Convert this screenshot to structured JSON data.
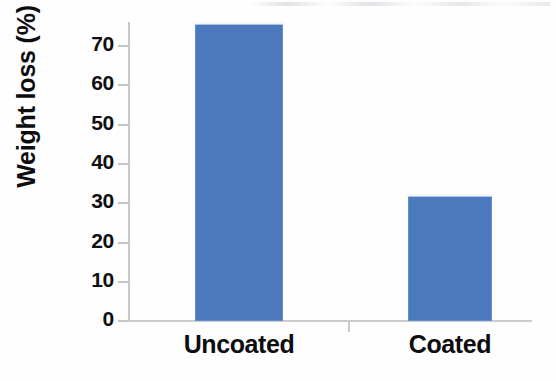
{
  "chart_data": {
    "type": "bar",
    "title": "",
    "subtitle": "",
    "xlabel": "",
    "ylabel": "Weight loss (%)",
    "categories": [
      "Uncoated",
      "Coated"
    ],
    "values": [
      69.5,
      29.3
    ],
    "series": [
      {
        "name": "Weight loss",
        "values": [
          69.5,
          29.3
        ],
        "color": "#4b79be"
      }
    ],
    "ylim": [
      0,
      70
    ],
    "ytick_labels": [
      "0",
      "10",
      "20",
      "30",
      "40",
      "50",
      "60",
      "70"
    ],
    "ytick_values": [
      0,
      10,
      20,
      30,
      40,
      50,
      60,
      70
    ],
    "xtick_labels": [
      "Uncoated",
      "Coated"
    ],
    "grid": false,
    "legend": false,
    "legend_position": "none",
    "annotations": [],
    "axis_color": "#c9c9cd",
    "text_color": "#0d0d10",
    "background_color": "#ffffff"
  }
}
